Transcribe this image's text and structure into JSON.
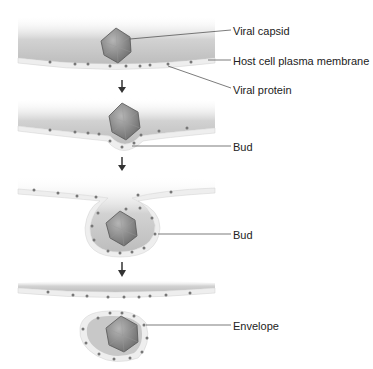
{
  "diagram": {
    "labels": {
      "viral_capsid": "Viral capsid",
      "host_membrane": "Host cell plasma membrane",
      "viral_protein": "Viral protein",
      "bud_1": "Bud",
      "bud_2": "Bud",
      "envelope": "Envelope"
    },
    "stages": [
      {
        "id": 1,
        "description": "Capsid approaches membrane with viral proteins"
      },
      {
        "id": 2,
        "description": "Membrane begins to bud around capsid"
      },
      {
        "id": 3,
        "description": "Bud forms enclosing capsid"
      },
      {
        "id": 4,
        "description": "Enveloped virus released"
      }
    ],
    "colors": {
      "cytoplasm": "#c9c9c9",
      "membrane": "#eeeeee",
      "capsid": "#8a8a8a",
      "protein_dot": "#777777",
      "arrow": "#333333",
      "leader": "#444444"
    }
  }
}
